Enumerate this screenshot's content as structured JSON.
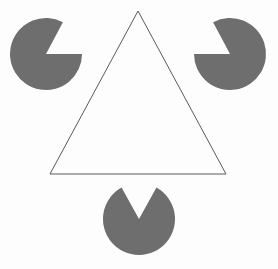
{
  "figure": {
    "title": "Kanizsa Triangle",
    "type": "optical-illusion",
    "canvas": {
      "width": 278,
      "height": 269
    },
    "colors": {
      "background": "#fdfdfd",
      "disc_fill": "#6e6e6e",
      "outline_stroke": "#5a5a5a",
      "outline_fill": "none"
    },
    "stroke_width": 1
  },
  "chart_data": {
    "type": "scatter",
    "title": "Kanizsa Triangle",
    "xlabel": "",
    "ylabel": "",
    "xlim": [
      0,
      278
    ],
    "ylim": [
      0,
      269
    ],
    "grid": false,
    "legend": "none",
    "annotations": [
      "Three notched discs (pac-man shapes) placed at the corners of an illusory upright triangle",
      "One thin outlined downward-facing triangle overlaps the discs",
      "The illusory bright triangle appears with vertices at the three disc notches"
    ],
    "shapes": [
      {
        "name": "disc-top-left",
        "kind": "pac-man",
        "cx": 46,
        "cy": 54,
        "r": 36,
        "wedge_start_deg": -62,
        "wedge_end_deg": 0,
        "notch_direction": "east-northeast",
        "fill": "#6e6e6e"
      },
      {
        "name": "disc-top-right",
        "kind": "pac-man",
        "cx": 230,
        "cy": 54,
        "r": 36,
        "wedge_start_deg": 180,
        "wedge_end_deg": 242,
        "notch_direction": "west-southwest",
        "fill": "#6e6e6e"
      },
      {
        "name": "disc-bottom-center",
        "kind": "pac-man",
        "cx": 139,
        "cy": 219,
        "r": 36,
        "wedge_start_deg": 241,
        "wedge_end_deg": 299,
        "notch_direction": "north",
        "fill": "#6e6e6e"
      },
      {
        "name": "outline-triangle",
        "kind": "triangle-outline",
        "vertices": [
          [
            138,
            11
          ],
          [
            226,
            174
          ],
          [
            50,
            174
          ]
        ],
        "stroke": "#5a5a5a",
        "stroke_width": 1,
        "fill": "none"
      }
    ],
    "illusory_triangle": {
      "name": "illusory-triangle",
      "description": "Subjective contour triangle defined by the three disc notches",
      "vertices": [
        [
          139,
          183
        ],
        [
          82,
          54
        ],
        [
          194,
          54
        ]
      ],
      "visible": false
    }
  }
}
